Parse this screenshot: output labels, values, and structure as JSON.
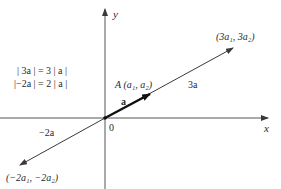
{
  "diagram": {
    "axes": {
      "x_label": "x",
      "y_label": "y",
      "origin_label": "0"
    },
    "equations": [
      "| 3a | = 3 | a |",
      "|−2a | = 2 | a |"
    ],
    "points": {
      "A": "A (a₁, a₂)",
      "three_a_tip": "(3a₁, 3a₂)",
      "neg_two_a_tip": "(−2a₁, −2a₂)"
    },
    "vectors": {
      "a": "a",
      "three_a": "3a",
      "neg_two_a": "−2a"
    },
    "colors": {
      "line": "#3a3a3a",
      "axis": "#555555",
      "text": "#2a2a2a"
    }
  }
}
